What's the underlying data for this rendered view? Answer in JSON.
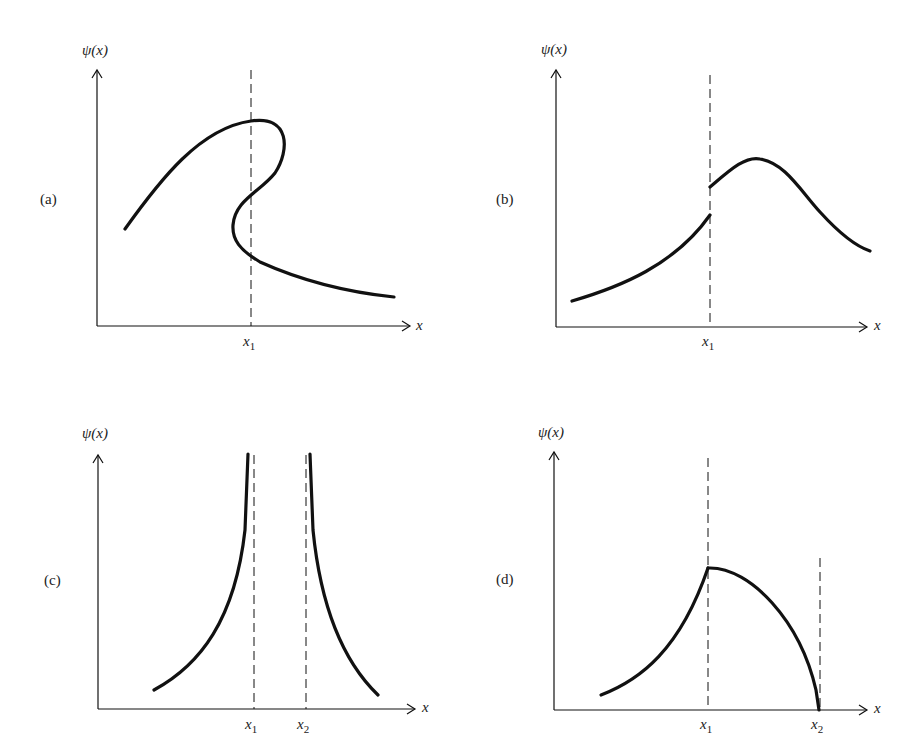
{
  "figure": {
    "panels": [
      {
        "id": "a",
        "label": "(a)",
        "y_axis_label": "ψ(x)",
        "x_axis_label": "x",
        "markers": [
          {
            "name": "x",
            "sub": "1"
          }
        ]
      },
      {
        "id": "b",
        "label": "(b)",
        "y_axis_label": "ψ(x)",
        "x_axis_label": "x",
        "markers": [
          {
            "name": "x",
            "sub": "1"
          }
        ]
      },
      {
        "id": "c",
        "label": "(c)",
        "y_axis_label": "ψ(x)",
        "x_axis_label": "x",
        "markers": [
          {
            "name": "x",
            "sub": "1"
          },
          {
            "name": "x",
            "sub": "2"
          }
        ]
      },
      {
        "id": "d",
        "label": "(d)",
        "y_axis_label": "ψ(x)",
        "x_axis_label": "x",
        "markers": [
          {
            "name": "x",
            "sub": "1"
          },
          {
            "name": "x",
            "sub": "2"
          }
        ]
      }
    ],
    "colors": {
      "ink": "#111111",
      "background": "#ffffff"
    }
  }
}
